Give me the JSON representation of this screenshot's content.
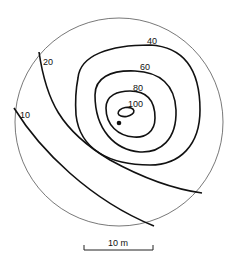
{
  "diagram": {
    "type": "contour-map",
    "contours": [
      {
        "value": "10",
        "label": "10"
      },
      {
        "value": "20",
        "label": "20"
      },
      {
        "value": "40",
        "label": "40"
      },
      {
        "value": "60",
        "label": "60"
      },
      {
        "value": "80",
        "label": "80"
      },
      {
        "value": "100",
        "label": "100"
      }
    ],
    "marker": "point-marker",
    "scale_bar": {
      "label": "10 m"
    }
  }
}
